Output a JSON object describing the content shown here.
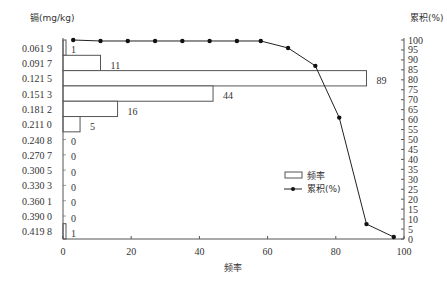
{
  "chart_data": {
    "type": "bar+line",
    "title": "",
    "ylabel_left": "镉(mg/kg)",
    "ylabel_right": "累积(%)",
    "xlabel": "频率",
    "categories": [
      "0.061 9",
      "0.091 7",
      "0.121 5",
      "0.151 3",
      "0.181 2",
      "0.211 0",
      "0.240 8",
      "0.270 7",
      "0.300 5",
      "0.330 3",
      "0.360 1",
      "0.390 0",
      "0.419 8"
    ],
    "series": [
      {
        "name": "频率",
        "type": "bar",
        "orientation": "horizontal",
        "values": [
          1,
          11,
          89,
          44,
          16,
          5,
          0,
          0,
          0,
          0,
          0,
          0,
          1
        ]
      },
      {
        "name": "累积(%)",
        "type": "line",
        "x": [
          3,
          11,
          19,
          27,
          35,
          43,
          51,
          58,
          66,
          74,
          81,
          89,
          97
        ],
        "values": [
          100,
          99.5,
          99.5,
          99.5,
          99.5,
          99.5,
          99.5,
          99.5,
          96,
          87,
          61,
          7.5,
          1
        ]
      }
    ],
    "xlim": [
      0,
      100
    ],
    "xticks": [
      "0",
      "20",
      "40",
      "60",
      "80",
      "100"
    ],
    "ylim_right": [
      0,
      100
    ],
    "yticks_right": [
      "0",
      "5",
      "10",
      "15",
      "20",
      "25",
      "30",
      "35",
      "40",
      "45",
      "50",
      "55",
      "60",
      "65",
      "70",
      "75",
      "80",
      "85",
      "90",
      "95",
      "100"
    ],
    "legend": [
      "频率",
      "累积(%)"
    ],
    "legend_position": "lower right inside",
    "grid": false
  }
}
